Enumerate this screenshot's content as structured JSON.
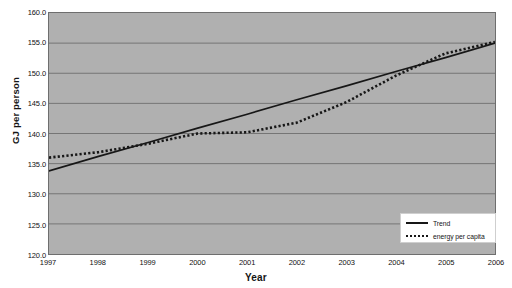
{
  "chart_data": {
    "type": "line",
    "title": "",
    "xlabel": "Year",
    "ylabel": "GJ per person",
    "xlim": [
      1997,
      2006
    ],
    "ylim": [
      120.0,
      160.0
    ],
    "grid": true,
    "legend_position": "bottom-right",
    "x_tick_labels": [
      "1997",
      "1998",
      "1999",
      "2000",
      "2001",
      "2002",
      "2003",
      "2004",
      "2005",
      "2006"
    ],
    "y_tick_labels": [
      "160.0",
      "155.0",
      "150.0",
      "145.0",
      "140.0",
      "135.0",
      "130.0",
      "125.0",
      "120.0"
    ],
    "x": [
      1997,
      1998,
      1999,
      2000,
      2001,
      2002,
      2003,
      2004,
      2005,
      2006
    ],
    "series": [
      {
        "name": "Trend",
        "style": "solid",
        "color": "#171717",
        "values": [
          133.8,
          136.2,
          138.5,
          140.9,
          143.2,
          145.6,
          147.9,
          150.3,
          152.6,
          155.0
        ]
      },
      {
        "name": "energy per capita",
        "style": "dotted",
        "color": "#171717",
        "values": [
          136.0,
          136.9,
          138.3,
          140.0,
          140.2,
          141.8,
          145.2,
          149.6,
          153.3,
          155.2
        ]
      }
    ]
  },
  "legend": {
    "items": [
      {
        "label": "Trend",
        "style": "solid"
      },
      {
        "label": "energy per capita",
        "style": "dotted"
      }
    ]
  },
  "colors": {
    "plot_background": "#b0b0b0",
    "page_background": "#ffffff",
    "gridline": "#6e6e6e",
    "axis": "#6e6e6e",
    "series_line": "#171717"
  }
}
